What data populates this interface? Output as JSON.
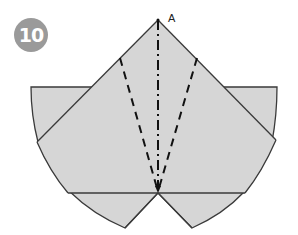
{
  "step": {
    "number": "10"
  },
  "diagram": {
    "point_label": "A",
    "fill_color": "#d6d6d6",
    "stroke_color": "#3a3a3a",
    "badge_color": "#9a9a9a",
    "lines": {
      "outline": "solid",
      "valley_folds": "dashed",
      "mountain_fold_center": "dash-dot"
    }
  }
}
